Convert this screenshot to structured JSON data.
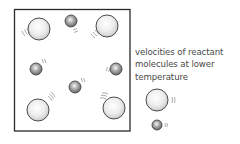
{
  "figure": {
    "type": "particle-container-diagram",
    "container": {
      "x": 14,
      "y": 9,
      "width": 116,
      "height": 122,
      "stroke": "#2a2a2a"
    },
    "molecules": [
      {
        "kind": "large",
        "cx": 39,
        "cy": 29,
        "r": 11,
        "motion": "lower-left"
      },
      {
        "kind": "large",
        "cx": 107,
        "cy": 26,
        "r": 11,
        "motion": "lower-left"
      },
      {
        "kind": "large",
        "cx": 38,
        "cy": 110,
        "r": 11,
        "motion": "upper-right"
      },
      {
        "kind": "large",
        "cx": 114,
        "cy": 108,
        "r": 11,
        "motion": "upper-left"
      },
      {
        "kind": "small",
        "cx": 71,
        "cy": 21,
        "r": 6,
        "motion": "down"
      },
      {
        "kind": "small",
        "cx": 36,
        "cy": 69,
        "r": 6,
        "motion": "upper-right"
      },
      {
        "kind": "small",
        "cx": 116,
        "cy": 69,
        "r": 6,
        "motion": "left"
      },
      {
        "kind": "small",
        "cx": 75,
        "cy": 87,
        "r": 6,
        "motion": "upper-right"
      }
    ],
    "colors": {
      "large_fill_light": "#ffffff",
      "large_fill_dark": "#c8c8c8",
      "small_fill_light": "#f4f4f4",
      "small_fill_dark": "#6a6a6a",
      "outline": "#3a3a3a",
      "motion_lines": "#8a8a8a",
      "text": "#4a4a4a"
    }
  },
  "legend": {
    "label_lines": [
      "velocities of reactant",
      "molecules at lower",
      "temperature"
    ],
    "large_sample": {
      "cx": 157,
      "cy": 100,
      "r": 11
    },
    "small_sample": {
      "cx": 157,
      "cy": 125,
      "r": 5
    }
  }
}
